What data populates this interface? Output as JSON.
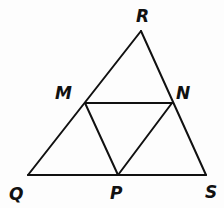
{
  "figure": {
    "background_color": "#fdfdfd",
    "stroke_color": "#111111",
    "stroke_width": 2,
    "label_color": "#111111"
  },
  "points": {
    "R": {
      "label": "R",
      "x": 141,
      "y": 31,
      "label_x": 136,
      "label_y": 22
    },
    "M": {
      "label": "M",
      "x": 85,
      "y": 103,
      "label_x": 55,
      "label_y": 99
    },
    "N": {
      "label": "N",
      "x": 172,
      "y": 103,
      "label_x": 176,
      "label_y": 99
    },
    "Q": {
      "label": "Q",
      "x": 28,
      "y": 175,
      "label_x": 9,
      "label_y": 200
    },
    "P": {
      "label": "P",
      "x": 118,
      "y": 175,
      "label_x": 110,
      "label_y": 199
    },
    "S": {
      "label": "S",
      "x": 206,
      "y": 175,
      "label_x": 205,
      "label_y": 198
    }
  },
  "segments": [
    {
      "name": "QR",
      "from": "Q",
      "to": "R",
      "x1": 28,
      "y1": 175,
      "x2": 141,
      "y2": 31
    },
    {
      "name": "RS",
      "from": "R",
      "to": "S",
      "x1": 141,
      "y1": 31,
      "x2": 206,
      "y2": 175
    },
    {
      "name": "QS",
      "from": "Q",
      "to": "S",
      "x1": 28,
      "y1": 175,
      "x2": 206,
      "y2": 175
    },
    {
      "name": "MN",
      "from": "M",
      "to": "N",
      "x1": 85,
      "y1": 103,
      "x2": 172,
      "y2": 103
    },
    {
      "name": "MP",
      "from": "M",
      "to": "P",
      "x1": 85,
      "y1": 103,
      "x2": 118,
      "y2": 175
    },
    {
      "name": "NP",
      "from": "N",
      "to": "P",
      "x1": 172,
      "y1": 103,
      "x2": 118,
      "y2": 175
    }
  ]
}
